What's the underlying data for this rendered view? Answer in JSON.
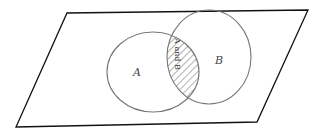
{
  "diagram": {
    "type": "venn",
    "universe": {
      "shape": "parallelogram",
      "stroke": "#111111"
    },
    "sets": [
      {
        "id": "A",
        "label": "A",
        "stroke": "#777777"
      },
      {
        "id": "B",
        "label": "B",
        "stroke": "#777777"
      }
    ],
    "intersection": {
      "label": "A and B",
      "fill": "hatched",
      "hatch_color": "#666666"
    }
  }
}
